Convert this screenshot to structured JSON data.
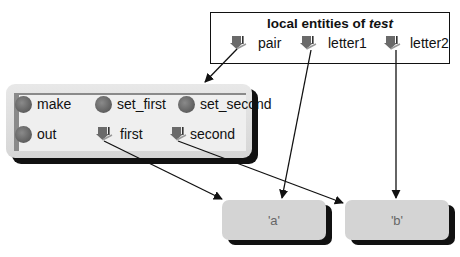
{
  "entities_box": {
    "title_prefix": "local entities of ",
    "title_name": "test",
    "items": [
      {
        "name": "pair",
        "icon": "pointer-icon"
      },
      {
        "name": "letter1",
        "icon": "pointer-icon"
      },
      {
        "name": "letter2",
        "icon": "pointer-icon"
      }
    ]
  },
  "object_box": {
    "methods": [
      {
        "name": "make",
        "icon": "method-dot-icon"
      },
      {
        "name": "set_first",
        "icon": "method-dot-icon"
      },
      {
        "name": "set_second",
        "icon": "method-dot-icon"
      },
      {
        "name": "out",
        "icon": "method-dot-icon"
      }
    ],
    "fields": [
      {
        "name": "first",
        "icon": "pointer-icon"
      },
      {
        "name": "second",
        "icon": "pointer-icon"
      }
    ]
  },
  "values": [
    {
      "label": "'a'"
    },
    {
      "label": "'b'"
    }
  ],
  "arrows": [
    {
      "from": "pair",
      "to": "object_box"
    },
    {
      "from": "letter1",
      "to": "'a'"
    },
    {
      "from": "letter2",
      "to": "'b'"
    },
    {
      "from": "first",
      "to": "'a'"
    },
    {
      "from": "second",
      "to": "'b'"
    }
  ],
  "colors": {
    "box_fill": "#d4d4d4",
    "dot": "#666666",
    "pointer": "#6a6a6a",
    "line": "#111111"
  }
}
